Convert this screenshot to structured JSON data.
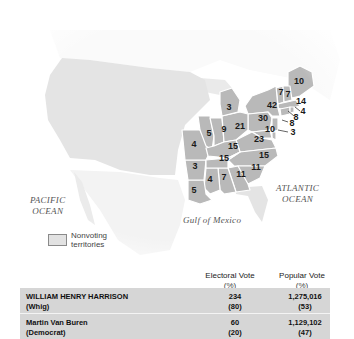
{
  "map": {
    "title": "Election of 1840",
    "labels": {
      "pacific": [
        "PACIFIC",
        "OCEAN"
      ],
      "atlantic": [
        "ATLANTIC",
        "OCEAN"
      ],
      "gulf": "Gulf of Mexico"
    },
    "legend": {
      "label_line1": "Nonvoting",
      "label_line2": "territories",
      "swatch_color": "#e2e2e2"
    },
    "colors": {
      "state_fill": "#b9b9b9",
      "territory_fill": "#e4e4e4",
      "foreign_fill": "#f3f3f3",
      "state_border": "#ffffff"
    },
    "states": [
      {
        "name": "Maine",
        "ev": "10"
      },
      {
        "name": "Vermont",
        "ev": "7"
      },
      {
        "name": "New Hampshire",
        "ev": "7"
      },
      {
        "name": "Massachusetts",
        "ev": "14"
      },
      {
        "name": "Rhode Island",
        "ev": "4"
      },
      {
        "name": "Connecticut",
        "ev": "8"
      },
      {
        "name": "New Jersey",
        "ev": "8"
      },
      {
        "name": "Delaware",
        "ev": "3"
      },
      {
        "name": "New York",
        "ev": "42"
      },
      {
        "name": "Pennsylvania",
        "ev": "30"
      },
      {
        "name": "Maryland",
        "ev": "10"
      },
      {
        "name": "Virginia",
        "ev": "23"
      },
      {
        "name": "North Carolina",
        "ev": "15"
      },
      {
        "name": "South Carolina",
        "ev": "11"
      },
      {
        "name": "Georgia",
        "ev": "11"
      },
      {
        "name": "Alabama",
        "ev": "7"
      },
      {
        "name": "Mississippi",
        "ev": "4"
      },
      {
        "name": "Louisiana",
        "ev": "5"
      },
      {
        "name": "Arkansas",
        "ev": "3"
      },
      {
        "name": "Missouri",
        "ev": "4"
      },
      {
        "name": "Illinois",
        "ev": "5"
      },
      {
        "name": "Indiana",
        "ev": "9"
      },
      {
        "name": "Ohio",
        "ev": "21"
      },
      {
        "name": "Michigan",
        "ev": "3"
      },
      {
        "name": "Kentucky",
        "ev": "15"
      },
      {
        "name": "Tennessee",
        "ev": "15"
      }
    ]
  },
  "table": {
    "headers": {
      "electoral": "Electoral Vote",
      "electoral_unit": "(%)",
      "popular": "Popular Vote",
      "popular_unit": "(%)"
    },
    "rows": [
      {
        "candidate": "WILLIAM HENRY HARRISON",
        "party": "(Whig)",
        "ev": "234",
        "ev_pct": "(80)",
        "pv": "1,275,016",
        "pv_pct": "(53)"
      },
      {
        "candidate": "Martin Van Buren",
        "party": "(Democrat)",
        "ev": "60",
        "ev_pct": "(20)",
        "pv": "1,129,102",
        "pv_pct": "(47)"
      }
    ],
    "bg_color": "#d6d6d6"
  }
}
